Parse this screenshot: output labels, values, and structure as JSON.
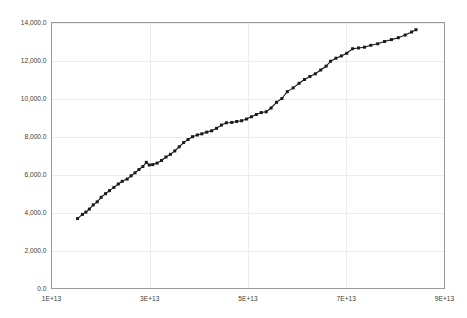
{
  "chart_data": {
    "type": "line",
    "title": "",
    "subtitle": "",
    "xlabel": "",
    "ylabel": "",
    "xlim": [
      10000000000000,
      90000000000000
    ],
    "ylim": [
      0,
      14000
    ],
    "grid": true,
    "legend": false,
    "legend_position": "none",
    "marker": "square",
    "line_color": "#1a1a1a",
    "grid_color": "#ededed",
    "axis_color": "#9a9a9a",
    "xticks": [
      10000000000000,
      30000000000000,
      50000000000000,
      70000000000000,
      90000000000000
    ],
    "xtick_labels": [
      "1E+13",
      "3E+13",
      "5E+13",
      "7E+13",
      "9E+13"
    ],
    "yticks": [
      0,
      2000,
      4000,
      6000,
      8000,
      10000,
      12000,
      14000
    ],
    "ytick_labels": [
      "0.0",
      "2,000.0",
      "4,000.0",
      "6,000.0",
      "8,000.0",
      "10,000.0",
      "12,000.0",
      "14,000.0"
    ],
    "series": [
      {
        "name": "series-1",
        "points": [
          [
            15300000000000,
            3680
          ],
          [
            16300000000000,
            3900
          ],
          [
            17000000000000,
            4020
          ],
          [
            17700000000000,
            4180
          ],
          [
            18500000000000,
            4400
          ],
          [
            19300000000000,
            4560
          ],
          [
            20100000000000,
            4800
          ],
          [
            21000000000000,
            4990
          ],
          [
            21800000000000,
            5150
          ],
          [
            22700000000000,
            5320
          ],
          [
            23600000000000,
            5500
          ],
          [
            24400000000000,
            5640
          ],
          [
            25400000000000,
            5760
          ],
          [
            26200000000000,
            5930
          ],
          [
            27000000000000,
            6090
          ],
          [
            27800000000000,
            6260
          ],
          [
            28600000000000,
            6420
          ],
          [
            29300000000000,
            6640
          ],
          [
            29900000000000,
            6500
          ],
          [
            30600000000000,
            6520
          ],
          [
            31500000000000,
            6600
          ],
          [
            32400000000000,
            6740
          ],
          [
            33300000000000,
            6920
          ],
          [
            34200000000000,
            7060
          ],
          [
            35100000000000,
            7240
          ],
          [
            36000000000000,
            7460
          ],
          [
            36900000000000,
            7680
          ],
          [
            37800000000000,
            7840
          ],
          [
            38700000000000,
            7990
          ],
          [
            39700000000000,
            8080
          ],
          [
            40600000000000,
            8140
          ],
          [
            41600000000000,
            8230
          ],
          [
            42600000000000,
            8300
          ],
          [
            43600000000000,
            8430
          ],
          [
            44600000000000,
            8600
          ],
          [
            45600000000000,
            8720
          ],
          [
            46700000000000,
            8740
          ],
          [
            47700000000000,
            8790
          ],
          [
            48700000000000,
            8830
          ],
          [
            49700000000000,
            8920
          ],
          [
            50700000000000,
            9040
          ],
          [
            51700000000000,
            9160
          ],
          [
            52700000000000,
            9260
          ],
          [
            53700000000000,
            9300
          ],
          [
            54700000000000,
            9500
          ],
          [
            55800000000000,
            9800
          ],
          [
            56900000000000,
            10000
          ],
          [
            58000000000000,
            10360
          ],
          [
            59200000000000,
            10560
          ],
          [
            60400000000000,
            10800
          ],
          [
            61500000000000,
            11000
          ],
          [
            62600000000000,
            11160
          ],
          [
            63700000000000,
            11300
          ],
          [
            64800000000000,
            11500
          ],
          [
            65900000000000,
            11700
          ],
          [
            66800000000000,
            11960
          ],
          [
            67900000000000,
            12120
          ],
          [
            69000000000000,
            12240
          ],
          [
            70100000000000,
            12380
          ],
          [
            71300000000000,
            12620
          ],
          [
            72500000000000,
            12660
          ],
          [
            73700000000000,
            12700
          ],
          [
            75000000000000,
            12800
          ],
          [
            76400000000000,
            12880
          ],
          [
            77800000000000,
            13000
          ],
          [
            79200000000000,
            13100
          ],
          [
            80600000000000,
            13200
          ],
          [
            82000000000000,
            13340
          ],
          [
            83300000000000,
            13500
          ],
          [
            84200000000000,
            13620
          ]
        ]
      }
    ]
  }
}
